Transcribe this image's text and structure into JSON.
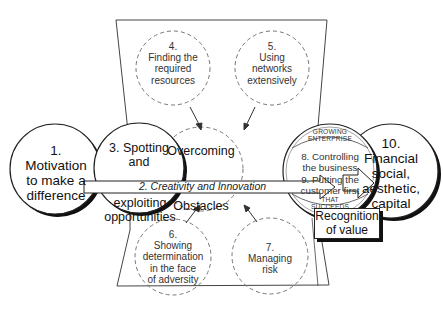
{
  "diagram": {
    "type": "entrepreneurship-process",
    "colors": {
      "stroke": "#222222",
      "dashed": "#777777",
      "background": "#ffffff",
      "shadow": "#111111"
    },
    "nodes": {
      "motivation": {
        "number": "1.",
        "lines": [
          "Motivation",
          "to make a",
          "difference"
        ]
      },
      "spotting": {
        "lines": [
          "3. Spotting",
          "and",
          "exploiting",
          "opportunities"
        ]
      },
      "overcoming": {
        "line1": "Overcoming",
        "line2": "Obstacles"
      },
      "resources": {
        "number": "4.",
        "lines": [
          "Finding the",
          "required",
          "resources"
        ]
      },
      "networks": {
        "number": "5.",
        "lines": [
          "Using",
          "networks",
          "extensively"
        ]
      },
      "determination": {
        "number": "6.",
        "lines": [
          "Showing",
          "determination",
          "in the face",
          "of adversity"
        ]
      },
      "risk": {
        "number": "7.",
        "lines": [
          "Managing",
          "risk"
        ]
      },
      "enterprise": {
        "arc_top": [
          "GROWING",
          "ENTERPRISE"
        ],
        "lines": [
          "8. Controlling",
          "the business",
          "9. Putting the",
          "customer first"
        ],
        "arc_bottom": [
          "THAT",
          "SUCCEEDS"
        ]
      },
      "capital": {
        "number": "10.",
        "lines": [
          "Financial",
          "social,",
          "aesthetic,",
          "capital"
        ]
      }
    },
    "arrow_label": "2. Creativity and Innovation",
    "recognition_box": {
      "lines": [
        "Recognition",
        "of value"
      ]
    }
  }
}
